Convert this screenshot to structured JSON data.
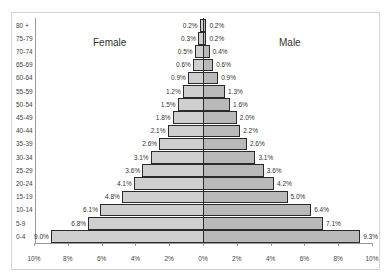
{
  "chart_data": {
    "type": "bar",
    "orientation": "horizontal",
    "subtype": "population-pyramid",
    "title": "",
    "categories": [
      "80 +",
      "75-79",
      "70-74",
      "65-69",
      "60-64",
      "55-59",
      "50-54",
      "45-49",
      "40-44",
      "35-39",
      "30-34",
      "25-29",
      "20-24",
      "15-19",
      "10-14",
      "5-9",
      "0-4"
    ],
    "series": [
      {
        "name": "Female",
        "values": [
          0.2,
          0.3,
          0.5,
          0.6,
          0.9,
          1.2,
          1.5,
          1.8,
          2.1,
          2.6,
          3.1,
          3.6,
          4.1,
          4.8,
          6.1,
          6.8,
          9.0
        ],
        "labels": [
          "0.2%",
          "0.3%",
          "0.5%",
          "0.6%",
          "0.9%",
          "1.2%",
          "1.5%",
          "1.8%",
          "2.1%",
          "2.6%",
          "3.1%",
          "3.6%",
          "4.1%",
          "4.8%",
          "6.1%",
          "6.8%",
          "9.0%"
        ]
      },
      {
        "name": "Male",
        "values": [
          0.2,
          0.2,
          0.4,
          0.6,
          0.9,
          1.3,
          1.6,
          2.0,
          2.2,
          2.6,
          3.1,
          3.6,
          4.2,
          5.0,
          6.4,
          7.1,
          9.3
        ],
        "labels": [
          "0.2%",
          "0.2%",
          "0.4%",
          "0.6%",
          "0.9%",
          "1.3%",
          "1.6%",
          "2.0%",
          "2.2%",
          "2.6%",
          "3.1%",
          "3.6%",
          "4.2%",
          "5.0%",
          "6.4%",
          "7.1%",
          "9.3%"
        ]
      }
    ],
    "xlabel": "",
    "ylabel": "",
    "x_tick_labels": [
      "10%",
      "8%",
      "6%",
      "4%",
      "2%",
      "0%",
      "2%",
      "4%",
      "6%",
      "8%",
      "10%"
    ],
    "xlim": [
      -10,
      10
    ],
    "grid": false,
    "legend": "none (inline text labels 'Female' left and 'Male' right)",
    "colors": {
      "female": "#cfcfcf",
      "male": "#b9b9b9",
      "outline": "#2a2a2a"
    }
  },
  "titles": {
    "female": "Female",
    "male": "Male"
  }
}
